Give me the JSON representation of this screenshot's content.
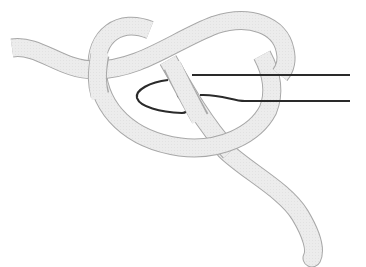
{
  "figure": {
    "elements": {
      "yarn": "yarn-strand",
      "hook": "crochet-hook",
      "loop": "slip-knot-loop"
    }
  },
  "colors": {
    "background": "#ffffff",
    "yarn_fill": "#ececec",
    "yarn_outline": "#a8a8a8",
    "hook_outline": "#2a2a2a"
  }
}
